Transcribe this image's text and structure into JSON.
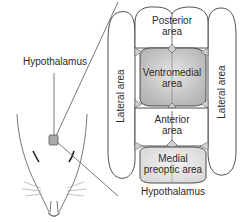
{
  "diagram": {
    "title_label": "Hypothalamus",
    "pointer_label": "Hypothalamus",
    "regions": {
      "posterior": {
        "line1": "Posterior",
        "line2": "area"
      },
      "ventromedial": {
        "line1": "Ventromedial",
        "line2": "area"
      },
      "anterior": {
        "line1": "Anterior",
        "line2": "area"
      },
      "medial_preoptic": {
        "line1": "Medial",
        "line2": "preoptic area"
      },
      "lateral_left": {
        "label": "Lateral area"
      },
      "lateral_right": {
        "label": "Lateral area"
      }
    },
    "icons": {
      "rat_head": "rat-head-outline",
      "marker": "hypothalamus-location-marker"
    },
    "colors": {
      "outline": "#3a3a3a",
      "ventromedial_fill": "#c8c8c8",
      "medial_preoptic_fill": "#e4e4e4",
      "marker_fill": "#a9a9a9",
      "background": "#ffffff"
    }
  }
}
